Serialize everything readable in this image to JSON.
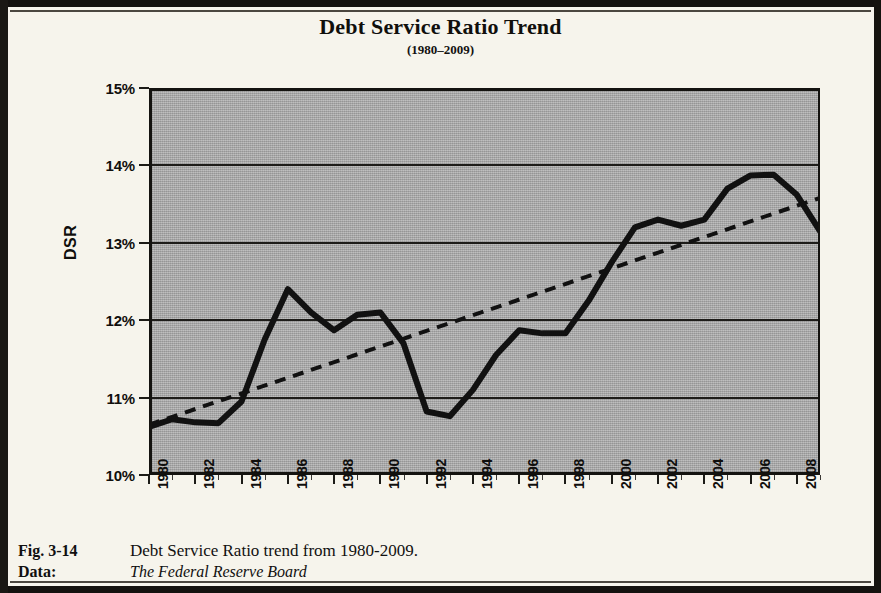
{
  "figure": {
    "title": "Debt Service Ratio Trend",
    "subtitle": "(1980–2009)",
    "caption_label": "Fig. 3-14",
    "caption_text": "Debt Service Ratio trend from 1980-2009.",
    "data_label": "Data:",
    "data_source": "The Federal Reserve Board"
  },
  "colors": {
    "page_background": "#f6f4ec",
    "plot_background": "#a9a9a9",
    "series_line": "#111111",
    "trendline": "#111111",
    "gridline": "#1d1c19",
    "border": "#141310",
    "text": "#100f0d"
  },
  "chart_data": {
    "type": "line",
    "title": "Debt Service Ratio Trend",
    "subtitle": "(1980–2009)",
    "xlabel": "",
    "ylabel": "DSR",
    "ylim": [
      10,
      15
    ],
    "xlim": [
      1980,
      2009
    ],
    "ytick_labels": [
      "15%",
      "14%",
      "13%",
      "12%",
      "11%",
      "10%"
    ],
    "ytick_values": [
      15,
      14,
      13,
      12,
      11,
      10
    ],
    "xtick_labels": [
      "1980",
      "1982",
      "1984",
      "1986",
      "1988",
      "1990",
      "1992",
      "1994",
      "1996",
      "1998",
      "2000",
      "2002",
      "2004",
      "2006",
      "2008"
    ],
    "xtick_values": [
      1980,
      1982,
      1984,
      1986,
      1988,
      1990,
      1992,
      1994,
      1996,
      1998,
      2000,
      2002,
      2004,
      2006,
      2008
    ],
    "grid": true,
    "grid_axis": "y",
    "legend": false,
    "series": [
      {
        "name": "DSR",
        "style": "solid",
        "x": [
          1980,
          1981,
          1982,
          1983,
          1984,
          1985,
          1986,
          1987,
          1988,
          1989,
          1990,
          1991,
          1992,
          1993,
          1994,
          1995,
          1996,
          1997,
          1998,
          1999,
          2000,
          2001,
          2002,
          2003,
          2004,
          2005,
          2006,
          2007,
          2008,
          2009
        ],
        "values": [
          10.62,
          10.72,
          10.68,
          10.67,
          10.95,
          11.75,
          12.4,
          12.1,
          11.87,
          12.07,
          12.1,
          11.7,
          10.82,
          10.76,
          11.1,
          11.55,
          11.87,
          11.83,
          11.83,
          12.25,
          12.75,
          13.2,
          13.3,
          13.22,
          13.3,
          13.7,
          13.87,
          13.88,
          13.62,
          13.15
        ]
      },
      {
        "name": "Linear trend",
        "style": "dashed",
        "x": [
          1980,
          2009
        ],
        "values": [
          10.65,
          13.58
        ]
      }
    ]
  }
}
